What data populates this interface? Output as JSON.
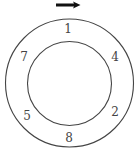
{
  "diagram": {
    "type": "ring-of-numbers",
    "direction": "clockwise",
    "arrow": {
      "icon": "right-arrow-icon",
      "color": "#111111"
    },
    "ring": {
      "stroke": "#444444"
    },
    "numbers": [
      {
        "label": "1",
        "position": "top"
      },
      {
        "label": "4",
        "position": "upper-right"
      },
      {
        "label": "2",
        "position": "lower-right"
      },
      {
        "label": "8",
        "position": "bottom"
      },
      {
        "label": "5",
        "position": "lower-left"
      },
      {
        "label": "7",
        "position": "upper-left"
      }
    ]
  }
}
